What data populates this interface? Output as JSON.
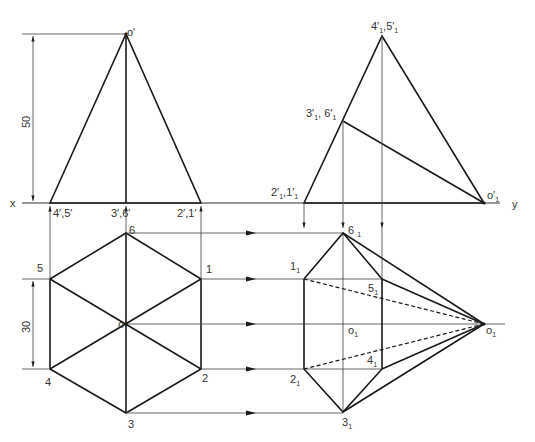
{
  "diagram": {
    "type": "orthographic-projection",
    "axis_labels": {
      "x": "x",
      "y": "y"
    },
    "dimensions": {
      "height": "50",
      "side": "30"
    },
    "front_view": {
      "apex": "o′",
      "base_points": [
        "4′,5′",
        "3′,6′",
        "2′,1′"
      ]
    },
    "top_view": {
      "center": "o",
      "vertices": [
        "1",
        "2",
        "3",
        "4",
        "5",
        "6"
      ]
    },
    "auxiliary_front_view": {
      "apex_top": "4′",
      "apex_top_b": "5′",
      "mid": "3′",
      "mid_b": "6′",
      "base_left": "2′",
      "base_left_b": "1′",
      "apex": "o′",
      "subscript": "1"
    },
    "auxiliary_top_view": {
      "vertices": [
        "6",
        "1",
        "5",
        "o",
        "4",
        "2",
        "3"
      ],
      "apex": "o",
      "subscript": "1"
    }
  }
}
